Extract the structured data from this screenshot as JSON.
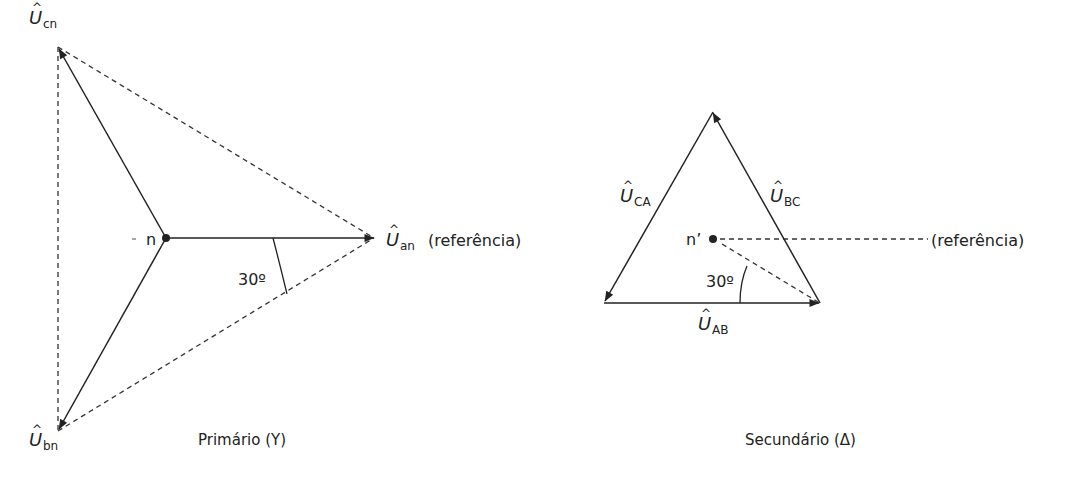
{
  "primary": {
    "caption": "Primário (Y)",
    "neutral_label": "n",
    "angle_label": "30º",
    "reference_label": "(referência)",
    "phasors": {
      "an": {
        "symbol": "U",
        "sub": "an"
      },
      "bn": {
        "symbol": "U",
        "sub": "bn"
      },
      "cn": {
        "symbol": "U",
        "sub": "cn"
      }
    }
  },
  "secondary": {
    "caption": "Secundário (Δ)",
    "neutral_label": "n’",
    "angle_label": "30º",
    "reference_label": "(referência)",
    "phasors": {
      "AB": {
        "symbol": "U",
        "sub": "AB"
      },
      "BC": {
        "symbol": "U",
        "sub": "BC"
      },
      "CA": {
        "symbol": "U",
        "sub": "CA"
      }
    }
  },
  "colors": {
    "line": "#222222",
    "text": "#222222",
    "background": "#ffffff"
  }
}
